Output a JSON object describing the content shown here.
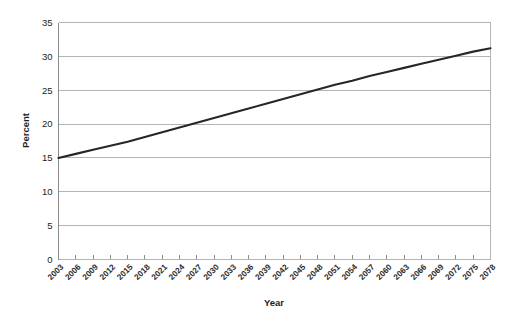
{
  "chart_data": {
    "type": "line",
    "title": "",
    "xlabel": "Year",
    "ylabel": "Percent",
    "ylim": [
      0,
      35
    ],
    "ytick_values": [
      0,
      5,
      10,
      15,
      20,
      25,
      30,
      35
    ],
    "ytick_labels": [
      "0",
      "5",
      "10",
      "15",
      "20",
      "25",
      "30",
      "35"
    ],
    "grid": true,
    "legend": "none",
    "categories": [
      "2003",
      "2006",
      "2009",
      "2012",
      "2015",
      "2018",
      "2021",
      "2024",
      "2027",
      "2030",
      "2033",
      "2036",
      "2039",
      "2042",
      "2045",
      "2048",
      "2051",
      "2054",
      "2057",
      "2060",
      "2063",
      "2066",
      "2069",
      "2072",
      "2075",
      "2078"
    ],
    "series": [
      {
        "name": "Percent",
        "values": [
          15.0,
          15.6,
          16.2,
          16.8,
          17.4,
          18.1,
          18.8,
          19.5,
          20.2,
          20.9,
          21.6,
          22.3,
          23.0,
          23.7,
          24.4,
          25.1,
          25.8,
          26.4,
          27.1,
          27.7,
          28.3,
          28.9,
          29.5,
          30.1,
          30.7,
          31.2
        ],
        "color": "#262626"
      }
    ],
    "colors": {
      "line": "#262626",
      "gridline": "#b4b4b4",
      "axis": "#8c8c8c",
      "text": "#1c1c1c",
      "background": "#ffffff"
    }
  }
}
